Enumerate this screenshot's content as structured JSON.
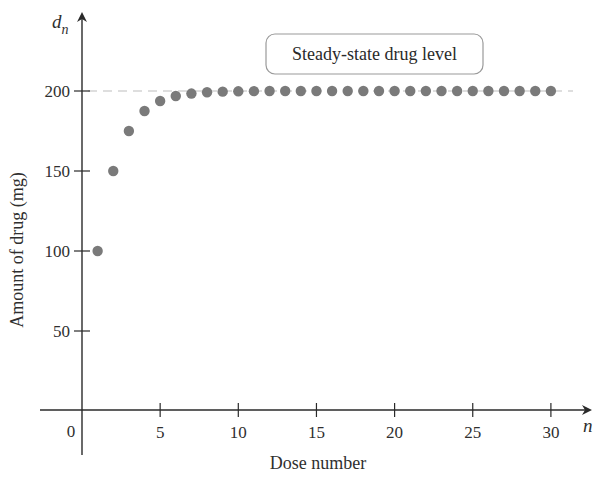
{
  "chart_data": {
    "type": "scatter",
    "title": "",
    "xlabel": "Dose number",
    "ylabel": "Amount of drug (mg)",
    "x_var": "n",
    "y_var": "d",
    "y_var_sub": "n",
    "xlim": [
      0,
      31
    ],
    "ylim": [
      0,
      220
    ],
    "x_ticks": [
      5,
      10,
      15,
      20,
      25,
      30
    ],
    "x_tick_labels": [
      "5",
      "10",
      "15",
      "20",
      "25",
      "30"
    ],
    "origin_label": "0",
    "y_ticks": [
      50,
      100,
      150,
      200
    ],
    "y_tick_labels": [
      "50",
      "100",
      "150",
      "200"
    ],
    "grid": false,
    "reference_line": {
      "y": 200,
      "style": "dashed",
      "color": "#bdbdbd"
    },
    "annotation": "Steady-state drug level",
    "point_color": "#7a7a7a",
    "series": [
      {
        "name": "Amount of drug",
        "x": [
          1,
          2,
          3,
          4,
          5,
          6,
          7,
          8,
          9,
          10,
          11,
          12,
          13,
          14,
          15,
          16,
          17,
          18,
          19,
          20,
          21,
          22,
          23,
          24,
          25,
          26,
          27,
          28,
          29,
          30
        ],
        "values": [
          100,
          150,
          175,
          187.5,
          193.75,
          196.9,
          198.4,
          199.2,
          199.6,
          199.8,
          199.9,
          200,
          200,
          200,
          200,
          200,
          200,
          200,
          200,
          200,
          200,
          200,
          200,
          200,
          200,
          200,
          200,
          200,
          200,
          200
        ]
      }
    ]
  }
}
